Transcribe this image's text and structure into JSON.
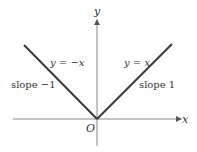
{
  "diagram": {
    "axes": {
      "x_label": "x",
      "y_label": "y",
      "origin_label": "O"
    },
    "lines": [
      {
        "equation": "y = −x",
        "slope_label": "slope −1"
      },
      {
        "equation": "y = x",
        "slope_label": "slope 1"
      }
    ],
    "colors": {
      "line": "#3a3a3a",
      "axis": "#8a8a8a",
      "text": "#333333"
    }
  }
}
